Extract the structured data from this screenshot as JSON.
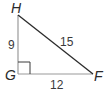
{
  "figure": {
    "type": "right-triangle",
    "vertices": {
      "H": {
        "label": "H"
      },
      "G": {
        "label": "G"
      },
      "F": {
        "label": "F"
      }
    },
    "sides": {
      "HG": {
        "label": "9"
      },
      "HF": {
        "label": "15"
      },
      "GF": {
        "label": "12"
      }
    },
    "right_angle_at": "G",
    "colors": {
      "line": "#2b2b2b",
      "side_gray": "#9a9a9a",
      "text": "#2a2a2a"
    }
  }
}
